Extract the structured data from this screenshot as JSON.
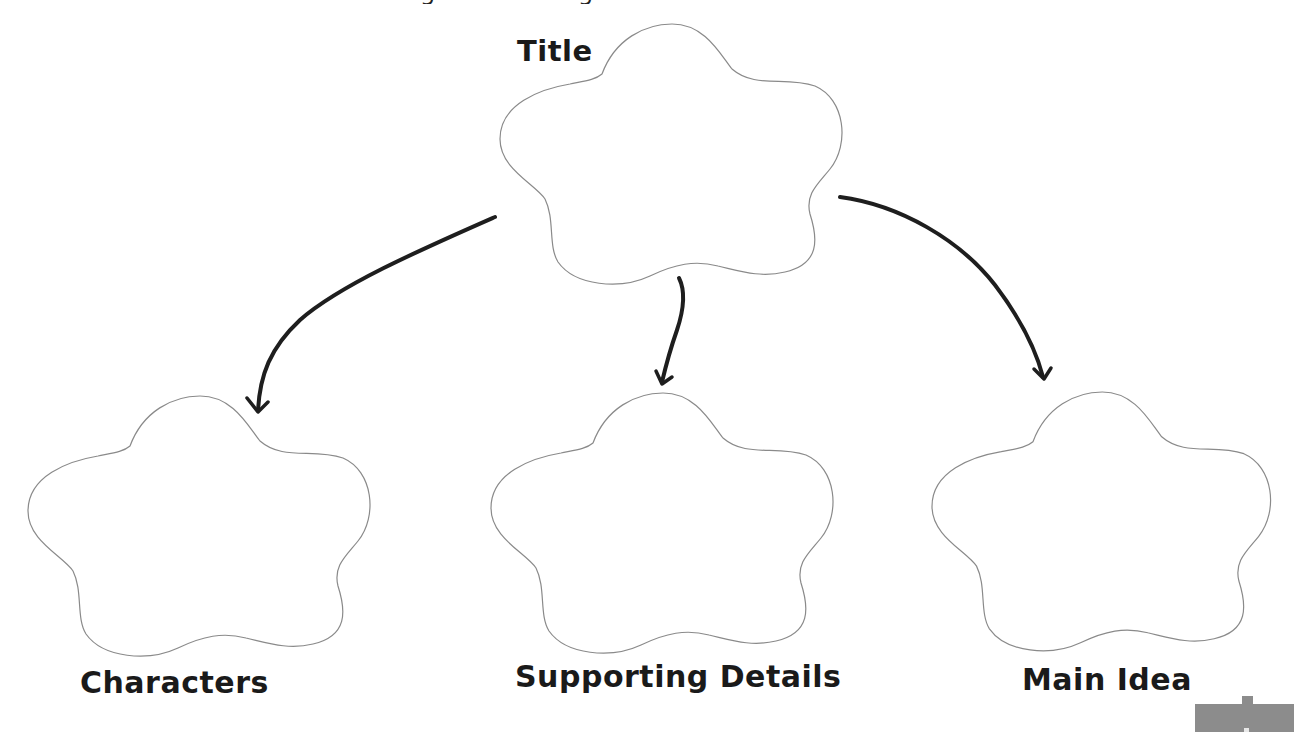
{
  "diagram": {
    "type": "graphic-organizer",
    "colors": {
      "background": "#ffffff",
      "cloud_outline": "#8a8a8a",
      "arrow": "#1e1e1e",
      "label_text": "#1a1a1a",
      "corner_tab": "#8c8c8c"
    },
    "nodes": [
      {
        "id": "title",
        "label": "Title",
        "position": "top-center"
      },
      {
        "id": "characters",
        "label": "Characters",
        "position": "bottom-left"
      },
      {
        "id": "supporting_details",
        "label": "Supporting Details",
        "position": "bottom-center"
      },
      {
        "id": "main_idea",
        "label": "Main Idea",
        "position": "bottom-right"
      }
    ],
    "edges": [
      {
        "from": "title",
        "to": "characters"
      },
      {
        "from": "title",
        "to": "supporting_details"
      },
      {
        "from": "title",
        "to": "main_idea"
      }
    ]
  },
  "labels": {
    "title": "Title",
    "characters": "Characters",
    "supporting_details": "Supporting Details",
    "main_idea": "Main Idea"
  }
}
